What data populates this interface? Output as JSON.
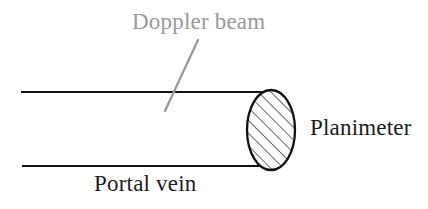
{
  "figure": {
    "type": "line-diagram",
    "background_color": "#ffffff",
    "title_text": null,
    "labels": {
      "doppler_beam": "Doppler beam",
      "planimeter": "Planimeter",
      "portal_vein": "Portal vein"
    },
    "colors": {
      "vessel_outline": "#111111",
      "cross_section_outline": "#111111",
      "hatching": "#3a3a3a",
      "annotation_gray": "#9a9a9a",
      "label_dark": "#1c1c1c",
      "background": "#ffffff"
    },
    "geometry": {
      "vessel_top_line": {
        "x1": 22,
        "y1": 92,
        "x2": 272,
        "y2": 92
      },
      "vessel_bottom_line": {
        "x1": 23,
        "y1": 166,
        "x2": 269,
        "y2": 166
      },
      "cross_section_ellipse": {
        "cx": 271,
        "cy": 130,
        "rx": 24,
        "ry": 40
      },
      "doppler_leader_line": {
        "x1": 198,
        "y1": 40,
        "x2": 165,
        "y2": 111
      },
      "hatch_angle_degrees": 45,
      "hatch_spacing_px": 9
    }
  }
}
